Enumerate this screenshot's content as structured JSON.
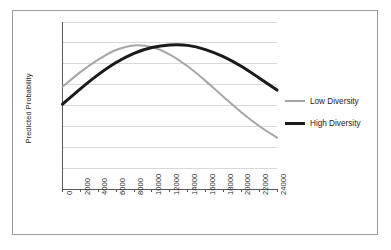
{
  "chart_data": {
    "type": "line",
    "title": "",
    "subtitle": "",
    "xlabel": "",
    "ylabel": "Predicted Probability",
    "xlim": [
      0,
      24000
    ],
    "ylim": [
      0.0,
      0.4
    ],
    "grid": "horizontal",
    "legend_position": "right",
    "x": [
      0,
      2000,
      4000,
      6000,
      8000,
      10000,
      12000,
      14000,
      16000,
      18000,
      20000,
      22000,
      24000
    ],
    "xticklabels": [
      "0",
      "2000",
      "4000",
      "6000",
      "8000",
      "10000",
      "12000",
      "14000",
      "16000",
      "18000",
      "20000",
      "22000",
      "24000"
    ],
    "yticks": [
      0.0,
      0.05,
      0.1,
      0.15,
      0.2,
      0.25,
      0.3,
      0.35,
      0.4
    ],
    "yticklabels": [
      "0.00",
      "0.05",
      "0.10",
      "0.15",
      "0.20",
      "0.25",
      "0.30",
      "0.35",
      "0.40"
    ],
    "series": [
      {
        "name": "Low Diversity",
        "color": "#a6a6a6",
        "width": 2,
        "values": [
          0.245,
          0.28,
          0.31,
          0.333,
          0.344,
          0.34,
          0.322,
          0.294,
          0.259,
          0.221,
          0.184,
          0.151,
          0.123
        ]
      },
      {
        "name": "High Diversity",
        "color": "#1a1a1a",
        "width": 3,
        "values": [
          0.203,
          0.24,
          0.274,
          0.303,
          0.325,
          0.339,
          0.345,
          0.344,
          0.334,
          0.317,
          0.294,
          0.266,
          0.237
        ]
      }
    ]
  },
  "legend": {
    "items": [
      {
        "label": "Low Diversity",
        "color": "#a6a6a6"
      },
      {
        "label": "High Diversity",
        "color": "#1a1a1a"
      }
    ]
  },
  "colors": {
    "low_diversity": "#a6a6a6",
    "high_diversity": "#1a1a1a",
    "grid": "#d9d9d9",
    "axis": "#595959",
    "frame": "#9a9a9a",
    "text": "#2b2b2b",
    "background": "#ffffff"
  }
}
